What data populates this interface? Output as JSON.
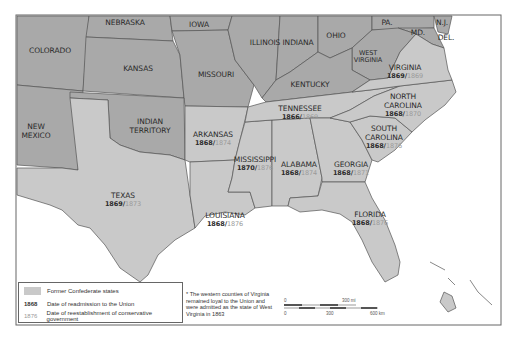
{
  "map": {
    "frame": {
      "x": 16,
      "y": 15,
      "width": 485,
      "height": 310
    },
    "colors": {
      "non_confederate": "#a9a9a9",
      "confederate": "#c9c9c9",
      "water": "#ffffff",
      "border": "#555555",
      "readmission_date": "#2a2a2a",
      "conservative_date": "#9a9a9a"
    },
    "states": [
      {
        "id": "colorado",
        "name": "COLORADO",
        "confederate": false
      },
      {
        "id": "nebraska",
        "name": "NEBRASKA",
        "confederate": false
      },
      {
        "id": "iowa",
        "name": "IOWA",
        "confederate": false
      },
      {
        "id": "illinois",
        "name": "ILLINOIS",
        "confederate": false
      },
      {
        "id": "indiana",
        "name": "INDIANA",
        "confederate": false
      },
      {
        "id": "ohio",
        "name": "OHIO",
        "confederate": false
      },
      {
        "id": "pa",
        "name": "PA.",
        "confederate": false
      },
      {
        "id": "nj",
        "name": "N.J.",
        "confederate": false
      },
      {
        "id": "md",
        "name": "MD.",
        "confederate": false
      },
      {
        "id": "del",
        "name": "DEL.",
        "confederate": false
      },
      {
        "id": "kansas",
        "name": "KANSAS",
        "confederate": false
      },
      {
        "id": "missouri",
        "name": "MISSOURI",
        "confederate": false
      },
      {
        "id": "west_virginia",
        "name": "WEST VIRGINIA",
        "confederate": false
      },
      {
        "id": "kentucky",
        "name": "KENTUCKY",
        "confederate": false
      },
      {
        "id": "new_mexico",
        "name": "NEW MEXICO",
        "confederate": false
      },
      {
        "id": "indian_territory",
        "name": "INDIAN TERRITORY",
        "confederate": false
      },
      {
        "id": "virginia",
        "name": "VIRGINIA",
        "confederate": true,
        "readmitted": "1869",
        "conservative": "1869"
      },
      {
        "id": "north_carolina",
        "name": "NORTH CAROLINA",
        "confederate": true,
        "readmitted": "1868",
        "conservative": "1870"
      },
      {
        "id": "tennessee",
        "name": "TENNESSEE",
        "confederate": true,
        "readmitted": "1866",
        "conservative": "1869"
      },
      {
        "id": "south_carolina",
        "name": "SOUTH CAROLINA",
        "confederate": true,
        "readmitted": "1868",
        "conservative": "1876"
      },
      {
        "id": "arkansas",
        "name": "ARKANSAS",
        "confederate": true,
        "readmitted": "1868",
        "conservative": "1874"
      },
      {
        "id": "mississippi",
        "name": "MISSISSIPPI",
        "confederate": true,
        "readmitted": "1870",
        "conservative": "1876"
      },
      {
        "id": "alabama",
        "name": "ALABAMA",
        "confederate": true,
        "readmitted": "1868",
        "conservative": "1874"
      },
      {
        "id": "georgia",
        "name": "GEORGIA",
        "confederate": true,
        "readmitted": "1868",
        "conservative": "1871"
      },
      {
        "id": "texas",
        "name": "TEXAS",
        "confederate": true,
        "readmitted": "1869",
        "conservative": "1873"
      },
      {
        "id": "louisiana",
        "name": "LOUISIANA",
        "confederate": true,
        "readmitted": "1868",
        "conservative": "1876"
      },
      {
        "id": "florida",
        "name": "FLORIDA",
        "confederate": true,
        "readmitted": "1868",
        "conservative": "1876"
      }
    ],
    "labels": {
      "colorado": "COLORADO",
      "nebraska": "NEBRASKA",
      "iowa": "IOWA",
      "illinois": "ILLINOIS",
      "indiana": "INDIANA",
      "ohio": "OHIO",
      "pa": "PA.",
      "nj": "N.J.",
      "md": "MD.",
      "del": "DEL.",
      "kansas": "KANSAS",
      "missouri": "MISSOURI",
      "west_virginia_1": "WEST",
      "west_virginia_2": "VIRGINIA",
      "kentucky": "KENTUCKY",
      "new_mexico_1": "NEW",
      "new_mexico_2": "MEXICO",
      "indian_territory_1": "INDIAN",
      "indian_territory_2": "TERRITORY",
      "virginia": "VIRGINIA",
      "north_carolina_1": "NORTH",
      "north_carolina_2": "CAROLINA",
      "tennessee": "TENNESSEE",
      "south_carolina_1": "SOUTH",
      "south_carolina_2": "CAROLINA",
      "arkansas": "ARKANSAS",
      "mississippi": "MISSISSIPPI",
      "alabama": "ALABAMA",
      "georgia": "GEORGIA",
      "texas": "TEXAS",
      "louisiana": "LOUISIANA",
      "florida": "FLORIDA"
    },
    "dates": {
      "virginia": {
        "re": "1869/",
        "cons": "1869"
      },
      "north_carolina": {
        "re": "1868/",
        "cons": "1870"
      },
      "tennessee": {
        "re": "1866/",
        "cons": "1869"
      },
      "south_carolina": {
        "re": "1868/",
        "cons": "1876"
      },
      "arkansas": {
        "re": "1868/",
        "cons": "1874"
      },
      "mississippi": {
        "re": "1870/",
        "cons": "1876"
      },
      "alabama": {
        "re": "1868/",
        "cons": "1874"
      },
      "georgia": {
        "re": "1868/",
        "cons": "1871"
      },
      "texas": {
        "re": "1869/",
        "cons": "1873"
      },
      "louisiana": {
        "re": "1868/",
        "cons": "1876"
      },
      "florida": {
        "re": "1868/",
        "cons": "1876"
      }
    }
  },
  "legend": {
    "swatch_label": "Former Confederate states",
    "readmission_year": "1868",
    "readmission_label": "Date of readmission to the Union",
    "conservative_year": "1876",
    "conservative_label": "Date of reestablishment of conservative government"
  },
  "footnote": "* The western counties of Virginia remained loyal to the Union and were admitted as the state of West Virginia in 1863",
  "scale_bar": {
    "top_zero": "0",
    "top_end": "300 mi",
    "bottom_zero": "0",
    "bottom_mid": "300",
    "bottom_end": "600 km"
  }
}
